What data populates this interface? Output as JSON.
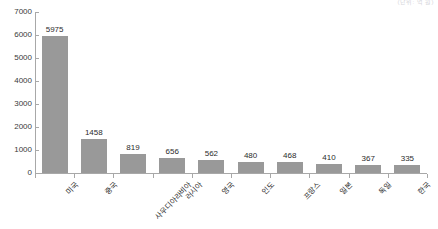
{
  "caption": "(단위: 억 원)",
  "chart_data": {
    "type": "bar",
    "title": "",
    "subtitle": "",
    "xlabel": "",
    "ylabel": "",
    "categories": [
      "미국",
      "중국",
      "사우디아라비아",
      "러시아",
      "영국",
      "인도",
      "프랑스",
      "일본",
      "독일",
      "한국"
    ],
    "values": [
      5975,
      1458,
      819,
      656,
      562,
      480,
      468,
      410,
      367,
      335
    ],
    "value_labels": [
      "5975",
      "1458",
      "819",
      "656",
      "562",
      "480",
      "468",
      "410",
      "367",
      "335"
    ],
    "ylim": [
      0,
      7000
    ],
    "ytick_values": [
      0,
      1000,
      2000,
      3000,
      4000,
      5000,
      6000,
      7000
    ],
    "ytick_labels": [
      "0",
      "1000",
      "2000",
      "3000",
      "4000",
      "5000",
      "6000",
      "7000"
    ],
    "grid": false,
    "legend": false,
    "legend_position": "none",
    "bar_color": "#999999",
    "axis_color": "#a8a8a8",
    "text_color": "#2b2b2b",
    "series": [
      {
        "name": "",
        "values": [
          5975,
          1458,
          819,
          656,
          562,
          480,
          468,
          410,
          367,
          335
        ]
      }
    ]
  }
}
